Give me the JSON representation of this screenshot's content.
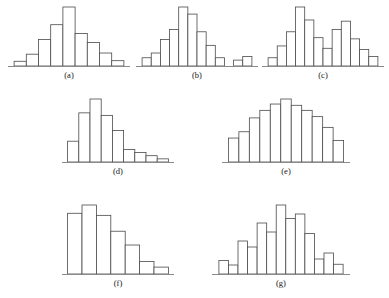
{
  "figure": {
    "background_color": "#ffffff",
    "bar_fill_color": "#ffffff",
    "bar_stroke_color": "#4a4a4a",
    "axis_color": "#8a8a8a",
    "label_color": "#141414"
  },
  "panels": [
    {
      "id": "a",
      "label": "(a)",
      "shape": "symmetric bell-shaped (normal)",
      "x": 8,
      "y": 4,
      "width": 122,
      "height": 74,
      "plot_height": 66
    },
    {
      "id": "b",
      "label": "(b)",
      "shape": "mound-shaped with outlier group",
      "x": 136,
      "y": 4,
      "width": 122,
      "height": 74,
      "plot_height": 66
    },
    {
      "id": "c",
      "label": "(c)",
      "shape": "bimodal",
      "x": 262,
      "y": 4,
      "width": 122,
      "height": 74,
      "plot_height": 66
    },
    {
      "id": "d",
      "label": "(d)",
      "shape": "skewed right",
      "x": 62,
      "y": 96,
      "width": 112,
      "height": 80,
      "plot_height": 70
    },
    {
      "id": "e",
      "label": "(e)",
      "shape": "symmetric broad mound",
      "x": 222,
      "y": 96,
      "width": 128,
      "height": 80,
      "plot_height": 70
    },
    {
      "id": "f",
      "label": "(f)",
      "shape": "strongly skewed right",
      "x": 62,
      "y": 202,
      "width": 112,
      "height": 86,
      "plot_height": 76
    },
    {
      "id": "g",
      "label": "(g)",
      "shape": "irregular / ragged",
      "x": 212,
      "y": 202,
      "width": 138,
      "height": 86,
      "plot_height": 76
    }
  ],
  "chart_data": [
    {
      "type": "bar",
      "id": "a",
      "title": "(a)",
      "xlabel": "",
      "ylabel": "",
      "grid": false,
      "legend": "none",
      "ylim": [
        0,
        100
      ],
      "axis_visible": "x-only",
      "categories": [
        "1",
        "2",
        "3",
        "4",
        "5",
        "6",
        "7",
        "8"
      ],
      "values": [
        8,
        20,
        45,
        70,
        100,
        55,
        40,
        22,
        9
      ],
      "gaps": []
    },
    {
      "type": "bar",
      "id": "b",
      "title": "(b)",
      "xlabel": "",
      "ylabel": "",
      "grid": false,
      "legend": "none",
      "ylim": [
        0,
        100
      ],
      "axis_visible": "x-only",
      "categories": [
        "1",
        "2",
        "3",
        "4",
        "5",
        "6",
        "7",
        "8",
        "9",
        "gap",
        "10",
        "11"
      ],
      "values": [
        14,
        22,
        45,
        62,
        100,
        88,
        58,
        35,
        14,
        0,
        10,
        16
      ],
      "gaps": [
        9
      ]
    },
    {
      "type": "bar",
      "id": "c",
      "title": "(c)",
      "xlabel": "",
      "ylabel": "",
      "grid": false,
      "legend": "none",
      "ylim": [
        0,
        100
      ],
      "axis_visible": "x-only",
      "categories": [
        "1",
        "2",
        "3",
        "4",
        "5",
        "6",
        "7",
        "8",
        "9",
        "10",
        "11"
      ],
      "values": [
        14,
        34,
        58,
        100,
        78,
        48,
        30,
        62,
        76,
        46,
        28,
        16
      ],
      "gaps": []
    },
    {
      "type": "bar",
      "id": "d",
      "title": "(d)",
      "xlabel": "",
      "ylabel": "",
      "grid": false,
      "legend": "none",
      "ylim": [
        0,
        100
      ],
      "axis_visible": "x-only",
      "categories": [
        "1",
        "2",
        "3",
        "4",
        "5",
        "6",
        "7",
        "8"
      ],
      "values": [
        33,
        78,
        100,
        74,
        50,
        20,
        15,
        10,
        5
      ],
      "gaps": []
    },
    {
      "type": "bar",
      "id": "e",
      "title": "(e)",
      "xlabel": "",
      "ylabel": "",
      "grid": false,
      "legend": "none",
      "ylim": [
        0,
        100
      ],
      "axis_visible": "x-only",
      "categories": [
        "1",
        "2",
        "3",
        "4",
        "5",
        "6",
        "7",
        "8",
        "9",
        "10",
        "11"
      ],
      "values": [
        38,
        48,
        70,
        82,
        92,
        100,
        90,
        82,
        72,
        55,
        34
      ],
      "gaps": []
    },
    {
      "type": "bar",
      "id": "f",
      "title": "(f)",
      "xlabel": "",
      "ylabel": "",
      "grid": false,
      "legend": "none",
      "ylim": [
        0,
        100
      ],
      "axis_visible": "x-only",
      "categories": [
        "1",
        "2",
        "3",
        "4",
        "5",
        "6"
      ],
      "values": [
        88,
        100,
        85,
        62,
        42,
        18,
        10
      ],
      "gaps": []
    },
    {
      "type": "bar",
      "id": "g",
      "title": "(g)",
      "xlabel": "",
      "ylabel": "",
      "grid": false,
      "legend": "none",
      "ylim": [
        0,
        100
      ],
      "axis_visible": "x-only",
      "categories": [
        "1",
        "2",
        "3",
        "4",
        "5",
        "6",
        "7",
        "8",
        "9",
        "10",
        "11",
        "12"
      ],
      "values": [
        18,
        12,
        44,
        36,
        68,
        56,
        92,
        74,
        80,
        54,
        20,
        28,
        13
      ],
      "gaps": []
    }
  ]
}
